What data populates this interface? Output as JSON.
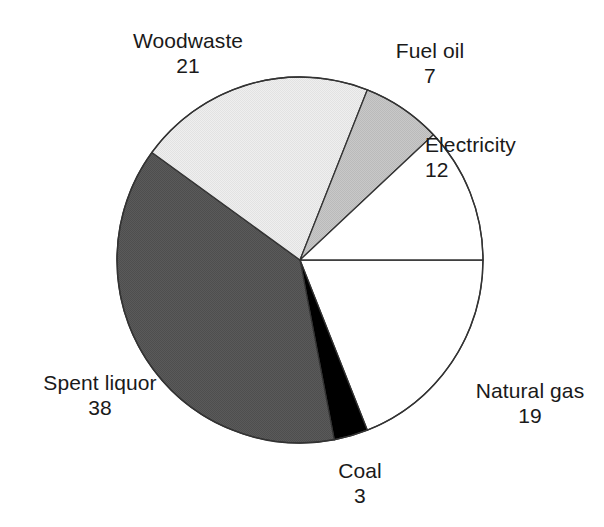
{
  "chart_data": {
    "type": "pie",
    "title": "",
    "subtitle": "",
    "xlabel": "",
    "ylabel": "",
    "legend_position": "none",
    "grid": false,
    "total": 100,
    "start_angle_deg": 0,
    "direction": "clockwise",
    "categories": [
      "Natural gas",
      "Coal",
      "Spent liquor",
      "Woodwaste",
      "Fuel oil",
      "Electricity"
    ],
    "values": [
      19,
      3,
      38,
      21,
      7,
      12
    ],
    "slices": [
      {
        "key": "natural-gas",
        "label": "Natural gas",
        "value": 19,
        "value_text": "19",
        "fill": "#ffffff",
        "stroke": "#333333",
        "start_deg": 0,
        "end_deg": 68.4
      },
      {
        "key": "coal",
        "label": "Coal",
        "value": 3,
        "value_text": "3",
        "fill": "#000000",
        "stroke": "#333333",
        "start_deg": 68.4,
        "end_deg": 79.2
      },
      {
        "key": "spent-liquor",
        "label": "Spent liquor",
        "value": 38,
        "value_text": "38",
        "fill": "#555555",
        "stroke": "#333333",
        "start_deg": 79.2,
        "end_deg": 216.0
      },
      {
        "key": "woodwaste",
        "label": "Woodwaste",
        "value": 21,
        "value_text": "21",
        "fill": "#ececec",
        "stroke": "#333333",
        "start_deg": 216.0,
        "end_deg": 291.6
      },
      {
        "key": "fuel-oil",
        "label": "Fuel oil",
        "value": 7,
        "value_text": "7",
        "fill": "#c2c2c2",
        "stroke": "#333333",
        "start_deg": 291.6,
        "end_deg": 316.8
      },
      {
        "key": "electricity",
        "label": "Electricity",
        "value": 12,
        "value_text": "12",
        "fill": "#ffffff",
        "stroke": "#333333",
        "start_deg": 316.8,
        "end_deg": 360.0
      }
    ],
    "geometry": {
      "center_x": 300,
      "center_y": 260,
      "radius": 183
    },
    "colors": {
      "background": "#ffffff",
      "outline": "#333333",
      "text": "#1a1a1a"
    }
  }
}
